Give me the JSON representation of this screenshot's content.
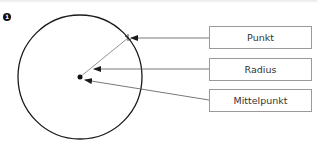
{
  "figure": {
    "badge": "1",
    "labels": {
      "punkt": "Punkt",
      "radius": "Radius",
      "mittelpunkt": "Mittelpunkt"
    }
  },
  "colors": {
    "stroke": "#1a1a1a",
    "box_border": "#9a9a9a",
    "text": "#333333"
  }
}
